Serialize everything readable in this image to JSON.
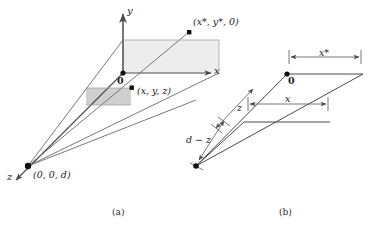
{
  "figure": {
    "width": 376,
    "height": 226,
    "background": "#ffffff",
    "line_color": "#4a4a4a",
    "axis_color": "#4a4a4a",
    "text_color": "#1a1a1a",
    "plane_fill_light": "#ededed",
    "plane_fill_dark": "#cfcfcf"
  },
  "panel_a": {
    "caption": "(a)",
    "axes": {
      "y_label": "y",
      "x_label": "x",
      "z_label": "z"
    },
    "points": {
      "origin_label": "0",
      "object_point_label": "(x, y, z)",
      "image_point_label": "(x*, y*, 0)",
      "center_of_projection_label": "(0, 0, d)"
    }
  },
  "panel_b": {
    "caption": "(b)",
    "points": {
      "origin_label": "0"
    },
    "dimensions": {
      "x_star_label": "x*",
      "x_label": "x",
      "z_label": "z",
      "d_minus_z_label": "d − z"
    }
  }
}
